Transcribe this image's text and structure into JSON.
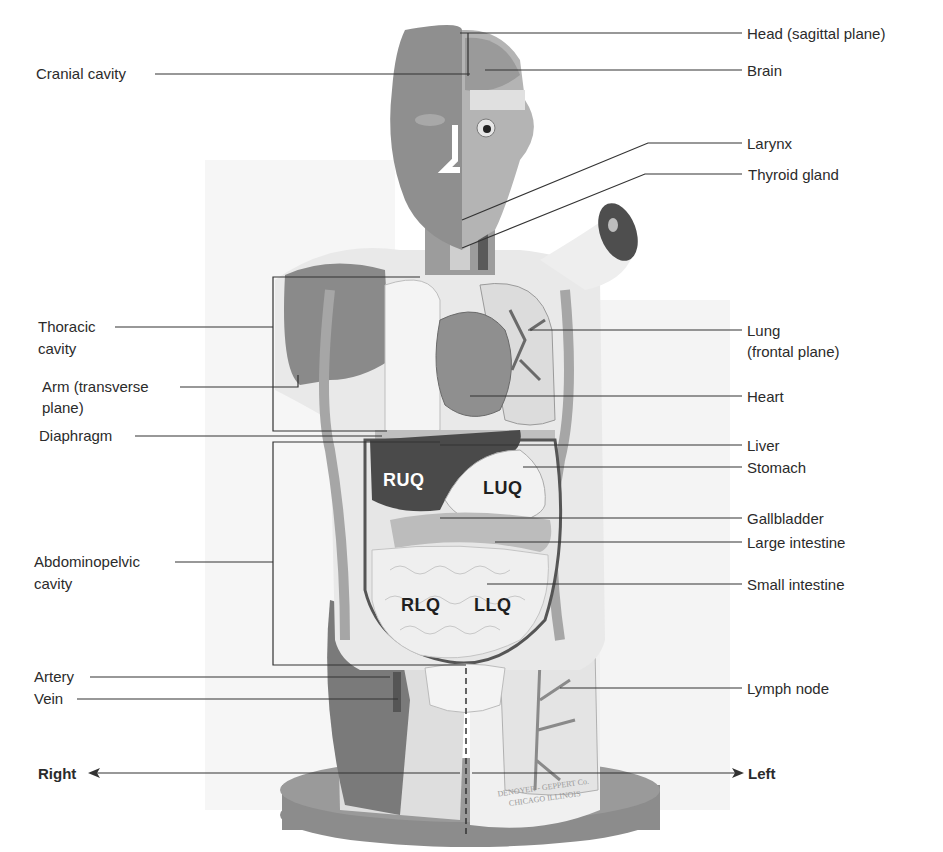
{
  "diagram": {
    "colors": {
      "background": "#ffffff",
      "leader_line": "#333333",
      "label_text": "#2b2b2b",
      "model_dark": "#6e6e6e",
      "model_mid": "#9a9a9a",
      "model_light": "#e8e8e8",
      "liver": "#4a4a4a",
      "base": "#8a8a8a"
    },
    "left_labels": {
      "cranial_cavity": "Cranial cavity",
      "thoracic_cavity_1": "Thoracic",
      "thoracic_cavity_2": "cavity",
      "arm_1": "Arm (transverse",
      "arm_2": "plane)",
      "diaphragm": "Diaphragm",
      "abdominopelvic_1": "Abdominopelvic",
      "abdominopelvic_2": "cavity",
      "artery": "Artery",
      "vein": "Vein"
    },
    "right_labels": {
      "head": "Head (sagittal plane)",
      "brain": "Brain",
      "larynx": "Larynx",
      "thyroid": "Thyroid gland",
      "lung_1": "Lung",
      "lung_2": "(frontal plane)",
      "heart": "Heart",
      "liver": "Liver",
      "stomach": "Stomach",
      "gallbladder": "Gallbladder",
      "large_intestine": "Large intestine",
      "small_intestine": "Small intestine",
      "lymph_node": "Lymph node"
    },
    "quadrants": {
      "ruq": "RUQ",
      "luq": "LUQ",
      "rlq": "RLQ",
      "llq": "LLQ"
    },
    "direction": {
      "right": "Right",
      "left": "Left"
    },
    "base_text": {
      "line1": "DENOYER - GEPPERT Co.",
      "line2": "CHICAGO ILLINOIS"
    }
  }
}
